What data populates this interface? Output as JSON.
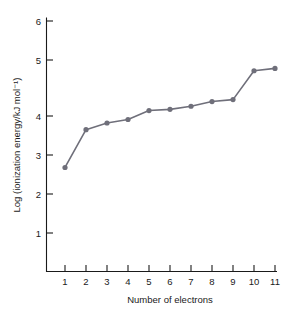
{
  "chart_data": {
    "type": "line",
    "title": "",
    "subtitle": "",
    "xlabel": "Number of electrons",
    "ylabel": "Log (ionization energy/kJ mol⁻¹)",
    "x": [
      1,
      2,
      3,
      4,
      5,
      6,
      7,
      8,
      9,
      10,
      11
    ],
    "values": [
      2.68,
      3.65,
      3.82,
      3.91,
      4.14,
      4.17,
      4.25,
      4.37,
      4.42,
      5.16,
      5.22
    ],
    "series": [
      {
        "name": "ionization energy",
        "values": [
          2.68,
          3.65,
          3.82,
          3.91,
          4.14,
          4.17,
          4.25,
          4.37,
          4.42,
          5.16,
          5.22
        ]
      }
    ],
    "xtick_labels": [
      "1",
      "2",
      "3",
      "4",
      "5",
      "6",
      "7",
      "8",
      "9",
      "10",
      "11"
    ],
    "ytick_labels": [
      "1",
      "2",
      "3",
      "4",
      "5",
      "6"
    ],
    "ytick_values": [
      1,
      2,
      3,
      4,
      5,
      6
    ],
    "xlim": [
      0.45,
      11.5
    ],
    "ylim": [
      0.35,
      6.25
    ],
    "grid": false,
    "legend": "none",
    "marker": "circle",
    "linestyle": "solid",
    "colors": {
      "line": "#6f6f7a",
      "marker": "#6f6f7a",
      "axis": "#1a1a1a",
      "text": "#1a1a1a",
      "background": "#ffffff"
    }
  }
}
